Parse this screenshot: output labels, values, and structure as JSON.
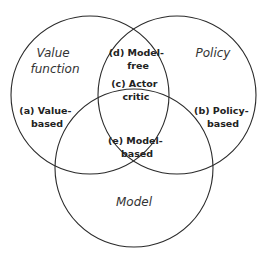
{
  "diagram": {
    "type": "venn",
    "colors": {
      "stroke": "#2a2a2a",
      "text": "#222222",
      "background": "#ffffff"
    },
    "sets": [
      {
        "id": "value",
        "label_lines": [
          "Value",
          "function"
        ],
        "cx": 90,
        "cy": 95,
        "r": 79
      },
      {
        "id": "policy",
        "label_lines": [
          "Policy"
        ],
        "cx": 177,
        "cy": 95,
        "r": 79
      },
      {
        "id": "model",
        "label_lines": [
          "Model"
        ],
        "cx": 134,
        "cy": 168,
        "r": 79
      }
    ],
    "regions": [
      {
        "id": "a",
        "label_lines": [
          "(a) Value-",
          "based"
        ]
      },
      {
        "id": "b",
        "label_lines": [
          "(b) Policy-",
          "based"
        ]
      },
      {
        "id": "c",
        "label_lines": [
          "(c) Actor",
          "critic"
        ]
      },
      {
        "id": "d",
        "label_lines": [
          "(d) Model-",
          "free"
        ]
      },
      {
        "id": "e",
        "label_lines": [
          "(e) Model-",
          "based"
        ]
      }
    ]
  }
}
